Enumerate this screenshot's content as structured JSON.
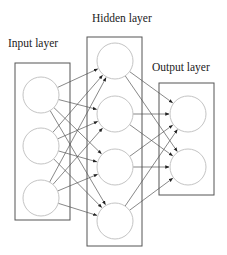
{
  "diagram": {
    "type": "neural-network",
    "layers": [
      {
        "id": "input",
        "label": "Input layer",
        "label_pos": [
          8,
          47
        ],
        "box": {
          "x": 15,
          "y": 63,
          "w": 55,
          "h": 157
        },
        "nodes": [
          {
            "id": "i1",
            "cx": 41,
            "cy": 95
          },
          {
            "id": "i2",
            "cx": 41,
            "cy": 146
          },
          {
            "id": "i3",
            "cx": 41,
            "cy": 198
          }
        ]
      },
      {
        "id": "hidden",
        "label": "Hidden layer",
        "label_pos": [
          92,
          22
        ],
        "box": {
          "x": 87,
          "y": 37,
          "w": 55,
          "h": 209
        },
        "nodes": [
          {
            "id": "h1",
            "cx": 115,
            "cy": 61
          },
          {
            "id": "h2",
            "cx": 115,
            "cy": 114
          },
          {
            "id": "h3",
            "cx": 115,
            "cy": 167
          },
          {
            "id": "h4",
            "cx": 115,
            "cy": 221
          }
        ]
      },
      {
        "id": "output",
        "label": "Output layer",
        "label_pos": [
          152,
          71
        ],
        "box": {
          "x": 159,
          "y": 83,
          "w": 55,
          "h": 112
        },
        "nodes": [
          {
            "id": "o1",
            "cx": 188,
            "cy": 114
          },
          {
            "id": "o2",
            "cx": 188,
            "cy": 167
          }
        ]
      }
    ],
    "node_radius": 18,
    "connections": "fully-connected",
    "edges_directed": true
  }
}
